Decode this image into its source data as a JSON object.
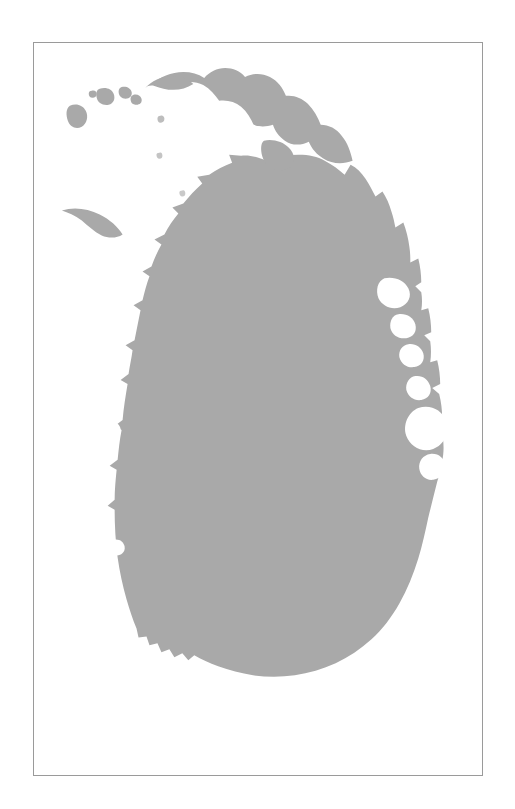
{
  "figure": {
    "type": "silhouette-map",
    "caption": "",
    "title": "",
    "background_color": "#ffffff",
    "land_color": "#a9a9a9",
    "sea_color": "#ffffff",
    "frame": {
      "visible": true,
      "border_color": "#9a9a9a",
      "border_width_px": 1,
      "x": 33,
      "y": 42,
      "width": 450,
      "height": 734
    },
    "labels": [],
    "legend": null,
    "scale_bar": null,
    "north_arrow": null,
    "graticule": false
  },
  "map_data": {
    "projection": "unprojected-silhouette",
    "features": [
      {
        "name": "sri-lanka-mainland",
        "kind": "island",
        "fill": "#a9a9a9",
        "path": "M 151 29 C 160 24 172 21 183 23 C 193 25 200 30 206 36 C 212 31 220 27 229 29 C 238 31 243 38 246 45 C 252 42 259 41 265 44 C 272 47 276 53 279 60 C 287 58 295 60 301 66 C 308 72 312 81 315 90 C 322 90 329 93 334 99 C 341 106 346 116 351 126 C 357 124 364 126 369 132 C 375 139 378 148 381 157 C 387 156 393 159 397 165 C 403 173 406 183 409 193 C 398 196 388 194 381 188 C 374 182 371 174 369 166 C 362 170 354 170 348 165 C 342 160 339 153 337 146 C 330 150 322 150 316 146 C 310 141 307 134 305 127 C 298 130 290 129 285 124 C 280 119 277 113 275 107 C 268 111 260 111 255 107 C 250 103 247 97 245 91 C 237 93 229 91 224 86 C 219 81 217 75 216 69 C 208 70 200 68 195 63 C 190 58 188 52 187 46 C 179 46 171 44 166 39 C 161 35 158 32 151 29 Z",
        "note": "jaffna-peninsula-outer"
      }
    ],
    "regions_depicted": [
      "Jaffna Peninsula",
      "Jaffna Lagoon",
      "Palk Strait islands",
      "Mannar Island",
      "Puttalam Lagoon",
      "Trincomalee Bay",
      "Batticaloa coast",
      "Southern coast",
      "Western coast"
    ]
  }
}
